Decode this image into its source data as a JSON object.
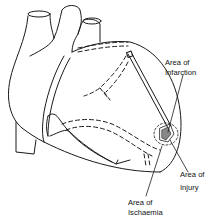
{
  "diagram": {
    "line_color": "#1a1a1a",
    "labels": [
      {
        "id": "infarction",
        "line1": "Area of",
        "line2": "Infarction"
      },
      {
        "id": "injury",
        "line1": "Area of",
        "line2": "Injury"
      },
      {
        "id": "ischaemia",
        "line1": "Area of",
        "line2": "Ischaemia"
      }
    ]
  }
}
